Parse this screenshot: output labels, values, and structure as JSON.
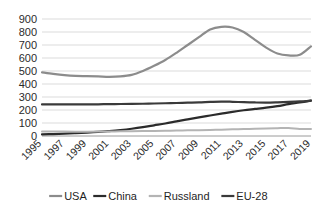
{
  "chart_data": {
    "type": "line",
    "title": "",
    "subtitle": "",
    "xlabel": "",
    "ylabel": "",
    "grid": true,
    "legend_position": "bottom",
    "ylim": [
      0,
      900
    ],
    "yticks": [
      0,
      100,
      200,
      300,
      400,
      500,
      600,
      700,
      800,
      900
    ],
    "ytick_labels": [
      "0",
      "100",
      "200",
      "300",
      "400",
      "500",
      "600",
      "700",
      "800",
      "900"
    ],
    "xlim": [
      1995,
      2019
    ],
    "x": [
      1995,
      1996,
      1997,
      1998,
      1999,
      2000,
      2001,
      2002,
      2003,
      2004,
      2005,
      2006,
      2007,
      2008,
      2009,
      2010,
      2011,
      2012,
      2013,
      2014,
      2015,
      2016,
      2017,
      2018,
      2019
    ],
    "xticks": [
      1995,
      1997,
      1999,
      2001,
      2003,
      2005,
      2007,
      2009,
      2011,
      2013,
      2015,
      2017,
      2019
    ],
    "xtick_labels": [
      "1995",
      "1997",
      "1999",
      "2001",
      "2003",
      "2005",
      "2007",
      "2009",
      "2011",
      "2013",
      "2015",
      "2017",
      "2019"
    ],
    "series": [
      {
        "name": "USA",
        "color": "#8c8c8c",
        "width": 2.2,
        "values": [
          490,
          478,
          468,
          462,
          460,
          458,
          455,
          458,
          470,
          500,
          540,
          585,
          640,
          700,
          760,
          820,
          840,
          835,
          800,
          740,
          680,
          635,
          620,
          625,
          690
        ]
      },
      {
        "name": "China",
        "color": "#2b2b2b",
        "width": 2.2,
        "values": [
          12,
          15,
          18,
          22,
          26,
          31,
          38,
          46,
          56,
          68,
          82,
          96,
          112,
          128,
          143,
          158,
          172,
          186,
          198,
          208,
          218,
          230,
          245,
          258,
          272
        ]
      },
      {
        "name": "Russland",
        "color": "#b4b4b4",
        "width": 2.0,
        "values": [
          34,
          34,
          34,
          33,
          33,
          34,
          35,
          36,
          37,
          38,
          39,
          40,
          42,
          44,
          45,
          47,
          49,
          51,
          53,
          55,
          57,
          60,
          62,
          54,
          54
        ]
      },
      {
        "name": "EU-28",
        "color": "#3a3a3a",
        "width": 2.2,
        "values": [
          243,
          243,
          243,
          243,
          243,
          244,
          245,
          246,
          247,
          248,
          250,
          252,
          254,
          256,
          258,
          262,
          265,
          263,
          260,
          258,
          257,
          259,
          262,
          266,
          272
        ]
      }
    ],
    "legend": [
      {
        "label": "USA",
        "color": "#8c8c8c"
      },
      {
        "label": "China",
        "color": "#2b2b2b"
      },
      {
        "label": "Russland",
        "color": "#b4b4b4"
      },
      {
        "label": "EU-28",
        "color": "#3a3a3a"
      }
    ]
  }
}
